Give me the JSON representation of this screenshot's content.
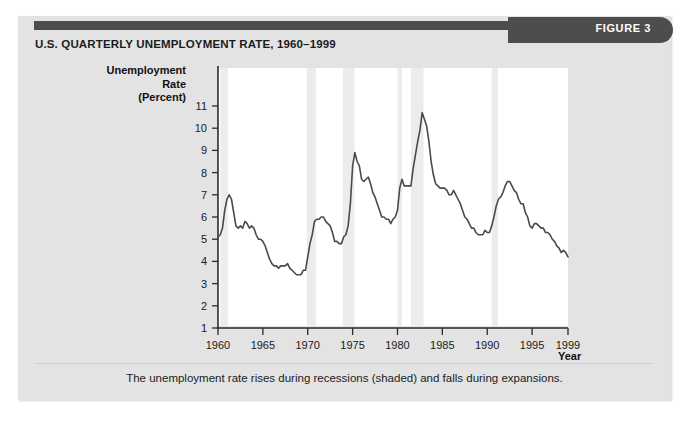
{
  "figure": {
    "tab_label": "FIGURE 3",
    "title": "U.S. QUARTERLY UNEMPLOYMENT RATE, 1960–1999",
    "caption": "The unemployment rate rises during recessions (shaded) and falls during expansions.",
    "colors": {
      "card_background": "#e3e3e3",
      "header_bar": "#4d4d4d",
      "tab_text": "#ffffff",
      "plot_background": "#ffffff",
      "recession_shade": "#ececec",
      "line": "#4a4a4a",
      "axis": "#2b2b2b"
    }
  },
  "chart_data": {
    "type": "line",
    "title": "U.S. QUARTERLY UNEMPLOYMENT RATE, 1960–1999",
    "xlabel": "Year",
    "ylabel": "Unemployment Rate (Percent)",
    "xlim": [
      1960,
      1999
    ],
    "ylim": [
      0,
      11.5
    ],
    "grid": false,
    "legend": null,
    "y_ticks": [
      1,
      2,
      3,
      4,
      5,
      6,
      7,
      8,
      9,
      10,
      11
    ],
    "x_ticks": [
      1960,
      1965,
      1970,
      1975,
      1980,
      1985,
      1990,
      1995,
      1999
    ],
    "y_tick_labels": [
      "1",
      "2",
      "3",
      "4",
      "5",
      "6",
      "7",
      "8",
      "9",
      "10",
      "11"
    ],
    "x_tick_labels": [
      "1960",
      "1965",
      "1970",
      "1975",
      "1980",
      "1985",
      "1990",
      "1995",
      "1999"
    ],
    "series": [
      {
        "name": "Unemployment rate",
        "x": [
          1960.0,
          1960.25,
          1960.5,
          1960.75,
          1961.0,
          1961.25,
          1961.5,
          1961.75,
          1962.0,
          1962.25,
          1962.5,
          1962.75,
          1963.0,
          1963.25,
          1963.5,
          1963.75,
          1964.0,
          1964.25,
          1964.5,
          1964.75,
          1965.0,
          1965.25,
          1965.5,
          1965.75,
          1966.0,
          1966.25,
          1966.5,
          1966.75,
          1967.0,
          1967.25,
          1967.5,
          1967.75,
          1968.0,
          1968.25,
          1968.5,
          1968.75,
          1969.0,
          1969.25,
          1969.5,
          1969.75,
          1970.0,
          1970.25,
          1970.5,
          1970.75,
          1971.0,
          1971.25,
          1971.5,
          1971.75,
          1972.0,
          1972.25,
          1972.5,
          1972.75,
          1973.0,
          1973.25,
          1973.5,
          1973.75,
          1974.0,
          1974.25,
          1974.5,
          1974.75,
          1975.0,
          1975.25,
          1975.5,
          1975.75,
          1976.0,
          1976.25,
          1976.5,
          1976.75,
          1977.0,
          1977.25,
          1977.5,
          1977.75,
          1978.0,
          1978.25,
          1978.5,
          1978.75,
          1979.0,
          1979.25,
          1979.5,
          1979.75,
          1980.0,
          1980.25,
          1980.5,
          1980.75,
          1981.0,
          1981.25,
          1981.5,
          1981.75,
          1982.0,
          1982.25,
          1982.5,
          1982.75,
          1983.0,
          1983.25,
          1983.5,
          1983.75,
          1984.0,
          1984.25,
          1984.5,
          1984.75,
          1985.0,
          1985.25,
          1985.5,
          1985.75,
          1986.0,
          1986.25,
          1986.5,
          1986.75,
          1987.0,
          1987.25,
          1987.5,
          1987.75,
          1988.0,
          1988.25,
          1988.5,
          1988.75,
          1989.0,
          1989.25,
          1989.5,
          1989.75,
          1990.0,
          1990.25,
          1990.5,
          1990.75,
          1991.0,
          1991.25,
          1991.5,
          1991.75,
          1992.0,
          1992.25,
          1992.5,
          1992.75,
          1993.0,
          1993.25,
          1993.5,
          1993.75,
          1994.0,
          1994.25,
          1994.5,
          1994.75,
          1995.0,
          1995.25,
          1995.5,
          1995.75,
          1996.0,
          1996.25,
          1996.5,
          1996.75,
          1997.0,
          1997.25,
          1997.5,
          1997.75,
          1998.0,
          1998.25,
          1998.5,
          1998.75,
          1999.0
        ],
        "y": [
          5.1,
          5.2,
          5.5,
          6.3,
          6.8,
          7.0,
          6.8,
          6.2,
          5.6,
          5.5,
          5.6,
          5.5,
          5.8,
          5.7,
          5.5,
          5.6,
          5.5,
          5.2,
          5.0,
          5.0,
          4.9,
          4.7,
          4.4,
          4.1,
          3.9,
          3.8,
          3.8,
          3.7,
          3.8,
          3.8,
          3.8,
          3.9,
          3.7,
          3.6,
          3.5,
          3.4,
          3.4,
          3.4,
          3.6,
          3.6,
          4.2,
          4.8,
          5.2,
          5.8,
          5.9,
          5.9,
          6.0,
          6.0,
          5.8,
          5.7,
          5.6,
          5.3,
          4.9,
          4.9,
          4.8,
          4.8,
          5.1,
          5.2,
          5.6,
          6.6,
          8.3,
          8.9,
          8.5,
          8.3,
          7.7,
          7.6,
          7.7,
          7.8,
          7.5,
          7.1,
          6.9,
          6.6,
          6.3,
          6.0,
          6.0,
          5.9,
          5.9,
          5.7,
          5.9,
          6.0,
          6.3,
          7.3,
          7.7,
          7.4,
          7.4,
          7.4,
          7.4,
          8.2,
          8.8,
          9.4,
          9.9,
          10.7,
          10.4,
          10.1,
          9.4,
          8.5,
          7.9,
          7.5,
          7.4,
          7.3,
          7.3,
          7.3,
          7.2,
          7.0,
          7.0,
          7.2,
          7.0,
          6.8,
          6.6,
          6.3,
          6.0,
          5.9,
          5.7,
          5.5,
          5.5,
          5.3,
          5.2,
          5.2,
          5.2,
          5.4,
          5.3,
          5.3,
          5.6,
          6.0,
          6.5,
          6.8,
          6.9,
          7.1,
          7.4,
          7.6,
          7.6,
          7.4,
          7.2,
          7.1,
          6.8,
          6.6,
          6.6,
          6.2,
          6.0,
          5.6,
          5.5,
          5.7,
          5.7,
          5.6,
          5.5,
          5.5,
          5.3,
          5.3,
          5.2,
          5.0,
          4.9,
          4.7,
          4.6,
          4.4,
          4.5,
          4.4,
          4.2
        ]
      }
    ],
    "recessions": [
      {
        "label": "1960–61",
        "start": 1960.25,
        "end": 1961.1
      },
      {
        "label": "1969–70",
        "start": 1969.9,
        "end": 1970.9
      },
      {
        "label": "1973–75",
        "start": 1973.9,
        "end": 1975.2
      },
      {
        "label": "1980",
        "start": 1980.0,
        "end": 1980.5
      },
      {
        "label": "1981–82",
        "start": 1981.5,
        "end": 1982.9
      },
      {
        "label": "1990–91",
        "start": 1990.5,
        "end": 1991.2
      }
    ]
  }
}
